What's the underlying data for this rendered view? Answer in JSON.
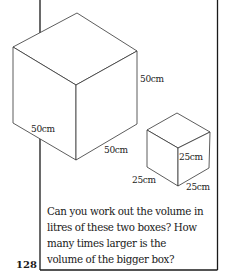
{
  "figure": {
    "big_box": {
      "dimension_labels": {
        "height": "50cm",
        "depth": "50cm",
        "width": "50cm"
      }
    },
    "small_box": {
      "dimension_labels": {
        "height": "25cm",
        "depth": "25cm",
        "width": "25cm"
      }
    }
  },
  "question": {
    "lines": [
      "Can you work out the volume in",
      "litres of these two boxes? How",
      "many times larger is the",
      "volume of the bigger box?"
    ]
  },
  "page_number": "128"
}
